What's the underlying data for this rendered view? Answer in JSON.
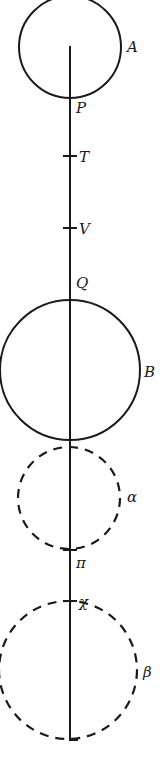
{
  "figure": {
    "axis": {
      "x": 70,
      "y_start": 46,
      "y_end": 740,
      "foot_x2": 78
    },
    "circles": [
      {
        "id": "A",
        "label": "A",
        "style": "solid",
        "cx": 70,
        "cy": 47,
        "r": 51,
        "label_x": 127,
        "label_y": 52
      },
      {
        "id": "B",
        "label": "B",
        "style": "solid",
        "cx": 70,
        "cy": 370,
        "r": 70,
        "label_x": 144,
        "label_y": 377
      },
      {
        "id": "alpha",
        "label": "α",
        "style": "dashed",
        "cx": 69,
        "cy": 498,
        "r": 51,
        "label_x": 127,
        "label_y": 502
      },
      {
        "id": "beta",
        "label": "β",
        "style": "dashed",
        "cx": 68,
        "cy": 670,
        "r": 69,
        "label_x": 143,
        "label_y": 677
      }
    ],
    "points": [
      {
        "id": "P",
        "label": "P",
        "y": 98,
        "tick": false,
        "label_x": 76,
        "label_y": 113
      },
      {
        "id": "T",
        "label": "T",
        "y": 156,
        "tick": true,
        "label_x": 79,
        "label_y": 162
      },
      {
        "id": "V",
        "label": "V",
        "y": 228,
        "tick": true,
        "label_x": 79,
        "label_y": 234
      },
      {
        "id": "Q",
        "label": "Q",
        "y": 299,
        "tick": false,
        "label_x": 76,
        "label_y": 288
      },
      {
        "id": "pi",
        "label": "π",
        "y": 550,
        "tick": true,
        "label_x": 76,
        "label_y": 568
      },
      {
        "id": "chi",
        "label": "χ",
        "y": 601,
        "tick": true,
        "label_x": 79,
        "label_y": 607
      }
    ]
  }
}
